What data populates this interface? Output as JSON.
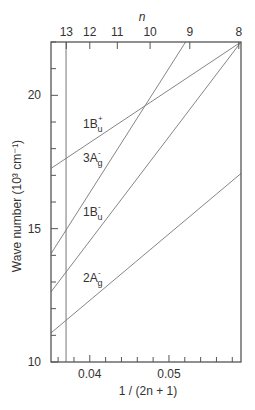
{
  "chart_data": {
    "type": "line",
    "title": "",
    "xlabel": "1 / (2n + 1)",
    "ylabel": "Wave number (10³ cm⁻¹)",
    "top_xlabel": "n",
    "xlim": [
      0.0351,
      0.0591
    ],
    "ylim": [
      10,
      22
    ],
    "x_ticks_major": [
      0.04,
      0.05
    ],
    "x_tick_labels": [
      "0.04",
      "0.05"
    ],
    "x_ticks_minor_step": 0.002,
    "y_ticks_major": [
      10,
      15,
      20
    ],
    "y_tick_labels": [
      "10",
      "15",
      "20"
    ],
    "y_ticks_minor_step": 1,
    "top_axis_ticks": [
      {
        "n": 13,
        "label": "13"
      },
      {
        "n": 12,
        "label": "12"
      },
      {
        "n": 11,
        "label": "11"
      },
      {
        "n": 10,
        "label": "10"
      },
      {
        "n": 9,
        "label": "9"
      },
      {
        "n": 8,
        "label": "8"
      }
    ],
    "vertical_line": {
      "x": 0.037,
      "label": "n = 13"
    },
    "grid": false,
    "legend": "inline labels",
    "series": [
      {
        "name": "1Bu+",
        "label_main": "1B",
        "label_sub": "u",
        "label_sup": "+",
        "x": [
          0.0351,
          0.0591
        ],
        "y": [
          17.26,
          22.0
        ],
        "label_pos": [
          83,
          128
        ]
      },
      {
        "name": "3Ag-",
        "label_main": "3A",
        "label_sub": "g",
        "label_sup": "-",
        "x": [
          0.0351,
          0.0521
        ],
        "y": [
          14.06,
          22.0
        ],
        "label_pos": [
          83,
          162
        ]
      },
      {
        "name": "1Bu-",
        "label_main": "1B",
        "label_sub": "u",
        "label_sup": "-",
        "x": [
          0.0351,
          0.0591
        ],
        "y": [
          12.63,
          22.0
        ],
        "label_pos": [
          83,
          216
        ]
      },
      {
        "name": "2Ag-",
        "label_main": "2A",
        "label_sub": "g",
        "label_sup": "-",
        "x": [
          0.0351,
          0.0591
        ],
        "y": [
          11.09,
          17.07
        ],
        "label_pos": [
          83,
          282
        ]
      }
    ]
  },
  "colors": {
    "axis": "#555555",
    "line": "#777777",
    "text": "#333333"
  }
}
